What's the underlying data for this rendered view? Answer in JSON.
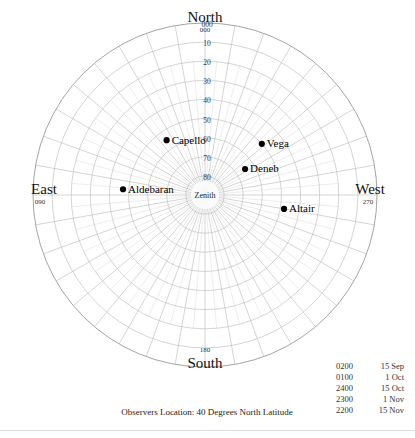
{
  "chart_data": {
    "type": "scatter",
    "projection": "polar-altazimuth",
    "title": "",
    "caption": "Observers Location: 40 Degrees North Latitude",
    "center_label": "Zenith",
    "grid": true,
    "azimuth_step_degrees": 10,
    "altitude_step_degrees": 10,
    "altitude_ticks": [
      "000",
      "10",
      "20",
      "30",
      "40",
      "50",
      "60",
      "70",
      "80"
    ],
    "altitude_tick_values": [
      0,
      10,
      20,
      30,
      40,
      50,
      60,
      70,
      80
    ],
    "cardinals": [
      {
        "name": "North",
        "azimuth": "000",
        "position": "top"
      },
      {
        "name": "East",
        "azimuth": "090",
        "position": "left"
      },
      {
        "name": "West",
        "azimuth": "270",
        "position": "right"
      },
      {
        "name": "South",
        "azimuth": "180",
        "position": "bottom"
      }
    ],
    "stars": [
      {
        "name": "Capello",
        "azimuth": 35,
        "altitude": 55,
        "label_side": "right"
      },
      {
        "name": "Vega",
        "azimuth": 312,
        "altitude": 50,
        "label_side": "right"
      },
      {
        "name": "Deneb",
        "azimuth": 303,
        "altitude": 65,
        "label_side": "right"
      },
      {
        "name": "Aldebaran",
        "azimuth": 86,
        "altitude": 47,
        "label_side": "right"
      },
      {
        "name": "Altair",
        "azimuth": 260,
        "altitude": 48,
        "label_side": "right"
      }
    ],
    "xlabel": "",
    "ylabel": "",
    "legend_position": "bottom-right"
  },
  "legend": {
    "rows": [
      {
        "time": "0200",
        "date": "15 Sep"
      },
      {
        "time": "0100",
        "date": "1 Oct"
      },
      {
        "time": "2400",
        "date": "15 Oct"
      },
      {
        "time": "2300",
        "date": "1 Nov"
      },
      {
        "time": "2200",
        "date": "15 Nov"
      }
    ]
  },
  "colors": {
    "grid": "#b8b8b8",
    "outline": "#9a9a9a",
    "star": "#000000",
    "text": "#111111",
    "rule": "#dcdcdc"
  }
}
